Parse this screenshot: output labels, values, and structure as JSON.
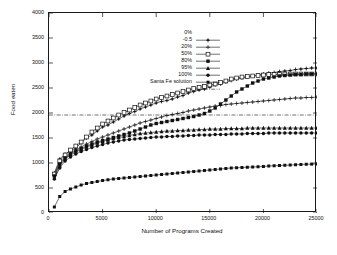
{
  "chart_data": {
    "type": "line",
    "title": "",
    "subtitle": "",
    "xlabel": "Number of Programs Created",
    "ylabel": "Food eaten",
    "xlim": [
      0,
      25000
    ],
    "ylim": [
      0,
      4000
    ],
    "xticks": [
      0,
      5000,
      10000,
      15000,
      20000,
      25000
    ],
    "yticks": [
      0,
      500,
      1000,
      1500,
      2000,
      2500,
      3000,
      3500,
      4000
    ],
    "grid": false,
    "legend_position": "upper-left-inside",
    "annotations": [
      {
        "name": "santa-fe-solution-line",
        "kind": "horizontal-reference-line",
        "value": 1960,
        "style": "dash-dot",
        "label": "Santa Fe solution"
      }
    ],
    "x": [
      500,
      1000,
      1500,
      2000,
      2500,
      3000,
      3500,
      4000,
      4500,
      5000,
      5500,
      6000,
      6500,
      7000,
      7500,
      8000,
      8500,
      9000,
      9500,
      10000,
      10500,
      11000,
      11500,
      12000,
      12500,
      13000,
      13500,
      14000,
      14500,
      15000,
      15500,
      16000,
      16500,
      17000,
      17500,
      18000,
      18500,
      19000,
      19500,
      20000,
      20500,
      21000,
      21500,
      22000,
      22500,
      23000,
      23500,
      24000,
      24500,
      25000
    ],
    "series": [
      {
        "name": "0%",
        "label": "0%",
        "marker": "plus-bar",
        "color": "#111111",
        "values": [
          800,
          1080,
          1180,
          1240,
          1300,
          1400,
          1500,
          1560,
          1640,
          1720,
          1760,
          1820,
          1880,
          1940,
          1990,
          2030,
          2080,
          2120,
          2160,
          2200,
          2230,
          2250,
          2280,
          2320,
          2350,
          2400,
          2430,
          2460,
          2480,
          2520,
          2560,
          2580,
          2620,
          2650,
          2680,
          2700,
          2720,
          2740,
          2760,
          2780,
          2800,
          2810,
          2830,
          2840,
          2850,
          2870,
          2880,
          2890,
          2900,
          2900
        ]
      },
      {
        "name": "-0.5",
        "label": "-0.5",
        "marker": "plus",
        "color": "#111111",
        "values": [
          760,
          1000,
          1120,
          1200,
          1260,
          1320,
          1380,
          1430,
          1480,
          1520,
          1560,
          1600,
          1640,
          1680,
          1720,
          1760,
          1800,
          1830,
          1860,
          1890,
          1920,
          1950,
          1970,
          1990,
          2010,
          2040,
          2060,
          2080,
          2100,
          2120,
          2140,
          2150,
          2170,
          2180,
          2190,
          2200,
          2210,
          2220,
          2230,
          2240,
          2250,
          2260,
          2270,
          2280,
          2290,
          2300,
          2300,
          2310,
          2310,
          2320
        ]
      },
      {
        "name": "20%",
        "label": "20%",
        "marker": "open-square",
        "color": "#111111",
        "values": [
          780,
          1040,
          1160,
          1260,
          1340,
          1420,
          1520,
          1620,
          1700,
          1780,
          1840,
          1900,
          1960,
          2010,
          2060,
          2110,
          2160,
          2200,
          2240,
          2280,
          2310,
          2340,
          2370,
          2400,
          2430,
          2460,
          2490,
          2510,
          2530,
          2560,
          2580,
          2610,
          2640,
          2680,
          2700,
          2720,
          2730,
          2740,
          2750,
          2760,
          2770,
          2770,
          2770,
          2780,
          2780,
          2780,
          2780,
          2780,
          2780,
          2780
        ]
      },
      {
        "name": "50%",
        "label": "50%",
        "marker": "filled-square",
        "color": "#111111",
        "values": [
          740,
          980,
          1100,
          1180,
          1240,
          1290,
          1340,
          1380,
          1420,
          1450,
          1480,
          1510,
          1540,
          1570,
          1600,
          1640,
          1680,
          1720,
          1760,
          1790,
          1810,
          1830,
          1850,
          1870,
          1890,
          1910,
          1930,
          1960,
          1990,
          2040,
          2100,
          2180,
          2260,
          2340,
          2420,
          2480,
          2540,
          2600,
          2640,
          2680,
          2700,
          2720,
          2740,
          2750,
          2760,
          2770,
          2770,
          2780,
          2780,
          2780
        ]
      },
      {
        "name": "80%",
        "label": "80%",
        "marker": "filled-triangle",
        "color": "#111111",
        "values": [
          700,
          940,
          1080,
          1160,
          1220,
          1270,
          1320,
          1360,
          1400,
          1430,
          1460,
          1490,
          1510,
          1530,
          1550,
          1570,
          1590,
          1600,
          1610,
          1620,
          1630,
          1640,
          1640,
          1650,
          1650,
          1660,
          1660,
          1670,
          1670,
          1680,
          1680,
          1680,
          1690,
          1690,
          1690,
          1690,
          1700,
          1700,
          1700,
          1700,
          1700,
          1700,
          1700,
          1700,
          1700,
          1700,
          1700,
          1700,
          1700,
          1700
        ]
      },
      {
        "name": "95%",
        "label": "95%",
        "marker": "filled-circle",
        "color": "#111111",
        "values": [
          680,
          900,
          1040,
          1120,
          1180,
          1230,
          1270,
          1310,
          1340,
          1370,
          1400,
          1420,
          1440,
          1460,
          1470,
          1480,
          1490,
          1500,
          1510,
          1520,
          1520,
          1530,
          1530,
          1540,
          1540,
          1550,
          1550,
          1560,
          1560,
          1560,
          1570,
          1570,
          1570,
          1580,
          1580,
          1580,
          1590,
          1590,
          1590,
          1590,
          1600,
          1600,
          1600,
          1600,
          1600,
          1600,
          1600,
          1600,
          1600,
          1600
        ]
      },
      {
        "name": "100%",
        "label": "100%",
        "marker": "filled-square-small",
        "color": "#111111",
        "values": [
          120,
          330,
          430,
          480,
          520,
          560,
          590,
          610,
          630,
          650,
          665,
          680,
          690,
          700,
          710,
          720,
          730,
          740,
          750,
          760,
          770,
          780,
          790,
          800,
          810,
          820,
          830,
          840,
          850,
          860,
          870,
          880,
          890,
          900,
          905,
          910,
          915,
          920,
          925,
          930,
          940,
          945,
          950,
          955,
          960,
          965,
          970,
          975,
          978,
          980
        ]
      }
    ]
  },
  "legend": {
    "entries": [
      {
        "label": "0%",
        "marker": "plus-bar"
      },
      {
        "label": "-0.5",
        "marker": "plus"
      },
      {
        "label": "20%",
        "marker": "open-square"
      },
      {
        "label": "50%",
        "marker": "filled-square"
      },
      {
        "label": "80%",
        "marker": "filled-triangle"
      },
      {
        "label": "95%",
        "marker": "filled-circle"
      },
      {
        "label": "100%",
        "marker": "filled-square-small"
      },
      {
        "label": "Santa Fe solution",
        "marker": "dash-dot-line"
      }
    ]
  },
  "axes": {
    "y_title": "Food eaten",
    "x_title": "Number of Programs Created",
    "y_tick_labels": [
      "0",
      "500",
      "1000",
      "1500",
      "2000",
      "2500",
      "3000",
      "3500",
      "4000"
    ],
    "x_tick_labels": [
      "0",
      "5000",
      "10000",
      "15000",
      "20000",
      "25000"
    ]
  },
  "colors": {
    "ink": "#111111",
    "background": "#ffffff"
  }
}
